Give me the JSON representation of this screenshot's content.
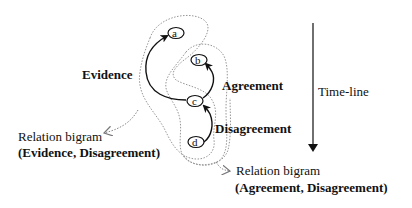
{
  "diagram": {
    "nodes": [
      {
        "id": "a",
        "label": "a"
      },
      {
        "id": "b",
        "label": "b"
      },
      {
        "id": "c",
        "label": "c"
      },
      {
        "id": "d",
        "label": "d"
      }
    ],
    "edges": [
      {
        "from": "c",
        "to": "a",
        "label": "Evidence"
      },
      {
        "from": "c",
        "to": "b",
        "label": "Agreement"
      },
      {
        "from": "d",
        "to": "c",
        "label": "Disagreement"
      }
    ],
    "timeline_label": "Time-line",
    "groups": [
      {
        "title": "Relation bigram",
        "pair": "(Evidence, Disagreement)"
      },
      {
        "title": "Relation bigram",
        "pair": "(Agreement, Disagreement)"
      }
    ],
    "colors": {
      "ink": "#111111",
      "dotted": "#8a8a8a"
    }
  }
}
